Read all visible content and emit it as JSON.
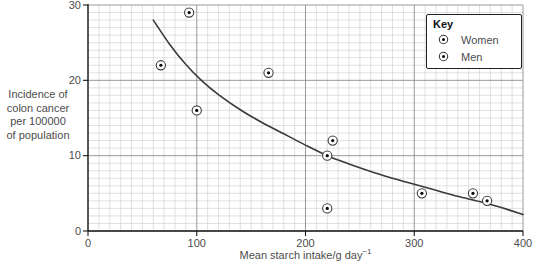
{
  "figure": {
    "background": "#ffffff",
    "key": {
      "title": "Key",
      "entries": [
        {
          "label": "Women",
          "marker": "circle-dot"
        },
        {
          "label": "Men",
          "marker": "circle-dot"
        }
      ]
    }
  },
  "chart_data": {
    "type": "scatter",
    "title": "",
    "xlabel": "Mean starch intake/g day",
    "xlabel_superscript": "−1",
    "ylabel": "Incidence of\ncolon cancer\nper 100000\nof population",
    "xlim": [
      0,
      400
    ],
    "ylim": [
      0,
      30
    ],
    "x_ticks": [
      0,
      100,
      200,
      300,
      400
    ],
    "y_ticks": [
      0,
      10,
      20,
      30
    ],
    "x_minor_step": 10,
    "x_major_step": 100,
    "y_minor_step": 1,
    "y_major_step": 10,
    "grid": true,
    "legend_position": "top-right",
    "series": [
      {
        "name": "Women",
        "marker": "circle-dot"
      },
      {
        "name": "Men",
        "marker": "circle-dot"
      }
    ],
    "points": [
      {
        "x": 67,
        "y": 22
      },
      {
        "x": 93,
        "y": 29
      },
      {
        "x": 100,
        "y": 16
      },
      {
        "x": 166,
        "y": 21
      },
      {
        "x": 225,
        "y": 12
      },
      {
        "x": 220,
        "y": 10
      },
      {
        "x": 220,
        "y": 3
      },
      {
        "x": 307,
        "y": 5
      },
      {
        "x": 354,
        "y": 5
      },
      {
        "x": 367,
        "y": 4
      }
    ],
    "trend_line": [
      {
        "x": 60,
        "y": 28.0
      },
      {
        "x": 75,
        "y": 24.8
      },
      {
        "x": 90,
        "y": 22.1
      },
      {
        "x": 105,
        "y": 19.9
      },
      {
        "x": 120,
        "y": 18.1
      },
      {
        "x": 140,
        "y": 16.1
      },
      {
        "x": 160,
        "y": 14.4
      },
      {
        "x": 180,
        "y": 12.9
      },
      {
        "x": 200,
        "y": 11.4
      },
      {
        "x": 220,
        "y": 10.0
      },
      {
        "x": 240,
        "y": 8.9
      },
      {
        "x": 260,
        "y": 7.9
      },
      {
        "x": 280,
        "y": 7.0
      },
      {
        "x": 300,
        "y": 6.2
      },
      {
        "x": 320,
        "y": 5.4
      },
      {
        "x": 340,
        "y": 4.6
      },
      {
        "x": 360,
        "y": 3.9
      },
      {
        "x": 380,
        "y": 3.1
      },
      {
        "x": 400,
        "y": 2.2
      }
    ]
  },
  "colors": {
    "background": "#ffffff",
    "minor_grid": "#cdcdcd",
    "major_grid": "#8f8f8f",
    "axis": "#1a1a1a",
    "curve": "#3a3a3a",
    "marker_stroke": "#3d3d3d",
    "marker_dot": "#0a0a0a",
    "text": "#4d4d4d",
    "key_border": "#222222"
  }
}
